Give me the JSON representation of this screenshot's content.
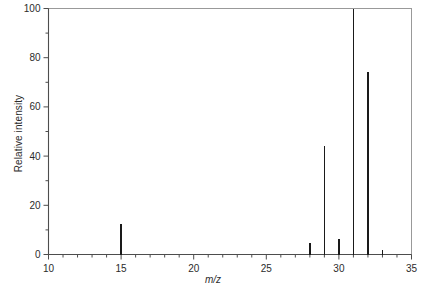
{
  "chart_data": {
    "type": "bar",
    "title": "",
    "subtitle": "",
    "xlabel": "m/z",
    "ylabel": "Relative intensity",
    "xlim": [
      10,
      35
    ],
    "ylim": [
      0,
      100
    ],
    "grid": false,
    "legend": "none",
    "xticks": [
      10,
      15,
      20,
      25,
      30,
      35
    ],
    "xtick_labels": [
      "10",
      "15",
      "20",
      "25",
      "30",
      "35"
    ],
    "x_minor_tick_step": 1,
    "yticks": [
      0,
      20,
      40,
      60,
      80,
      100
    ],
    "ytick_labels": [
      "0",
      "20",
      "40",
      "60",
      "80",
      "100"
    ],
    "y_minor_tick_step": 10,
    "categories": [
      15,
      28,
      29,
      30,
      31,
      32,
      33
    ],
    "values": [
      12.5,
      4.5,
      44,
      6.5,
      100,
      74,
      2
    ],
    "series": [
      {
        "name": "Relative intensity",
        "points": [
          {
            "x": 15,
            "y": 12.5
          },
          {
            "x": 28,
            "y": 4.5
          },
          {
            "x": 29,
            "y": 44
          },
          {
            "x": 30,
            "y": 6.5
          },
          {
            "x": 31,
            "y": 100
          },
          {
            "x": 32,
            "y": 74
          },
          {
            "x": 33,
            "y": 2
          }
        ]
      }
    ],
    "colors": {
      "peak": "#1a1a1a",
      "axis": "#4d4d4d",
      "frame": "#999999",
      "text": "#2b2b2b",
      "background": "#ffffff"
    }
  },
  "axis": {
    "x_label_text": "m/z",
    "y_label_text": "Relative intensity"
  }
}
